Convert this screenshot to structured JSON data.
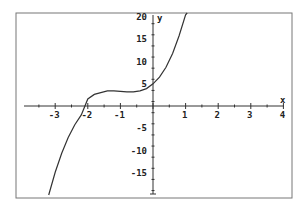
{
  "chart_data": {
    "type": "line",
    "title": "",
    "xlabel": "x",
    "ylabel": "y",
    "xlim": [
      -4,
      4
    ],
    "ylim": [
      -20,
      20
    ],
    "grid": false,
    "x_ticks": [
      -3,
      -2,
      -1,
      1,
      2,
      3,
      4
    ],
    "x_tick_labels": [
      "-3",
      "-2",
      "-1",
      "1",
      "2",
      "3",
      "4"
    ],
    "y_ticks": [
      20,
      15,
      10,
      5,
      -5,
      -10,
      -15
    ],
    "y_tick_labels": [
      "20",
      "15",
      "10",
      "5",
      "-5",
      "-10",
      "-15"
    ],
    "series": [
      {
        "name": "cubic curve",
        "x": [
          -3.2,
          -3.0,
          -2.8,
          -2.6,
          -2.4,
          -2.2,
          -2.0,
          -1.8,
          -1.6,
          -1.4,
          -1.2,
          -1.0,
          -0.8,
          -0.6,
          -0.4,
          -0.2,
          0.0,
          0.2,
          0.4,
          0.6,
          0.8,
          1.0,
          1.05
        ],
        "y": [
          -20.0,
          -14.9,
          -10.6,
          -7.1,
          -4.2,
          -2.0,
          1.6,
          2.6,
          3.0,
          3.4,
          3.4,
          3.3,
          3.2,
          3.2,
          3.4,
          3.9,
          5.0,
          6.5,
          8.7,
          11.8,
          15.8,
          20.5,
          21.8
        ]
      }
    ],
    "colors": {
      "curve": "#333333",
      "axes": "#333333",
      "frame": "#777777"
    }
  }
}
